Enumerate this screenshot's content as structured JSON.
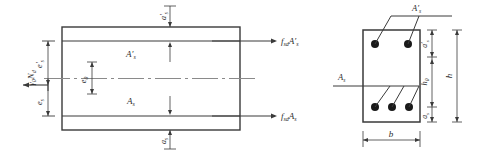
{
  "figure": {
    "stroke_color": "#3a3a3a",
    "text_color": "#2b2b2b",
    "rebar_color": "#1a1a1a"
  },
  "elevation": {
    "name": "elevation-view",
    "labels": {
      "axial_force": "γ0Nd",
      "axial_force_main": "N",
      "axial_force_sub_pre": "γ",
      "axial_force_sub_0": "0",
      "axial_force_sub_d": "d",
      "top_steel": "A′s",
      "bottom_steel": "As",
      "top_cover": "a′s",
      "bottom_cover": "as",
      "ecc_top": "e′s",
      "ecc_bottom": "es",
      "ecc_0": "e0",
      "force_top": "fsdA′s",
      "force_bottom": "fsdAs"
    },
    "symbols": {
      "A": "A",
      "e": "e",
      "a": "a",
      "f": "f",
      "N": "N",
      "gamma": "γ",
      "prime": "′",
      "sub_s": "s",
      "sub_0": "0",
      "sub_d": "d",
      "sub_sd": "sd"
    }
  },
  "cross_section": {
    "name": "cross-section-view",
    "labels": {
      "width": "b",
      "height": "h",
      "effective_height": "h0",
      "top_steel": "A′s",
      "bottom_steel": "As",
      "top_cover": "a′s",
      "bottom_cover": "as"
    },
    "rebars": {
      "top_count": 2,
      "bottom_count": 3
    }
  }
}
